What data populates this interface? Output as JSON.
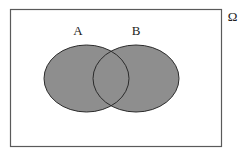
{
  "diagram": {
    "type": "venn",
    "universe": {
      "label": "Ω",
      "rect": {
        "x": 10.5,
        "y": 9.5,
        "width": 211,
        "height": 137
      },
      "stroke": "#5a5a5a"
    },
    "sets": [
      {
        "label": "A",
        "cx": 86.5,
        "cy": 78.5,
        "rx": 42.5,
        "ry": 33.5,
        "label_x": 78,
        "label_y": 35
      },
      {
        "label": "B",
        "cx": 136,
        "cy": 78.5,
        "rx": 43,
        "ry": 33.5,
        "label_x": 136,
        "label_y": 35
      }
    ],
    "fill_color": "#8e8e8e",
    "outline_color": "#2b2b2b"
  }
}
